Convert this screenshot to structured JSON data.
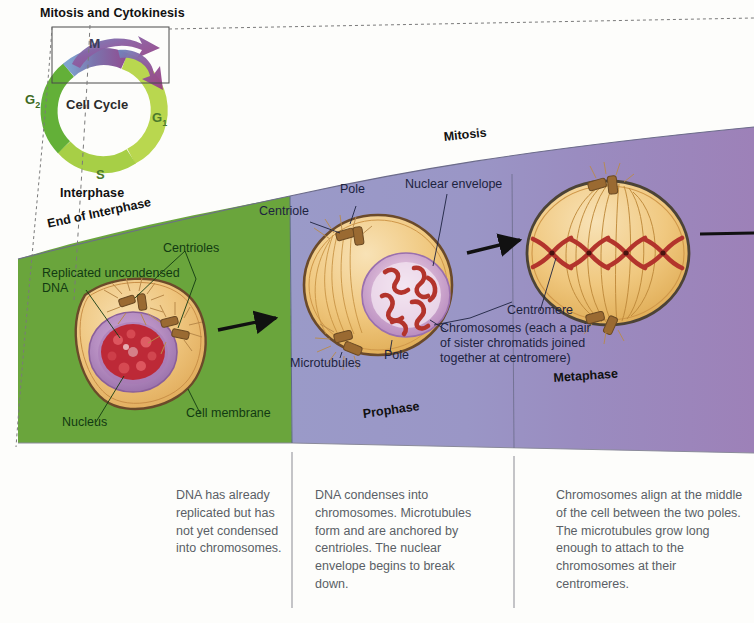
{
  "figure": {
    "cell_cycle": {
      "box_label": "Mitosis and Cytokinesis",
      "center_label": "Cell Cycle",
      "interphase_label": "Interphase",
      "segments": [
        {
          "name": "G1",
          "label": "G",
          "subscript": "1",
          "color": "#b5d44e"
        },
        {
          "name": "S",
          "label": "S",
          "subscript": "",
          "color": "#a6cf4a"
        },
        {
          "name": "G2",
          "label": "G",
          "subscript": "2",
          "color": "#67b23b"
        },
        {
          "name": "M",
          "label": "M",
          "subscript": "",
          "color": "#8d7fb8"
        }
      ]
    },
    "band_label_mitosis": "Mitosis",
    "band_label_end_interphase": "End of Interphase",
    "stages": [
      {
        "id": "interphase",
        "phase_label": "End of Interphase",
        "band_color": "#6aa53c",
        "caption": "DNA has already replicated but has not yet condensed into chromosomes.",
        "callouts": [
          "Replicated uncondensed DNA",
          "Centrioles",
          "Nucleus",
          "Cell membrane"
        ]
      },
      {
        "id": "prophase",
        "phase_label": "Prophase",
        "band_color": "#9a9ac8",
        "caption": "DNA condenses into chromosomes. Microtubules form and are anchored by centrioles. The nuclear envelope begins to break down.",
        "callouts": [
          "Pole",
          "Centriole",
          "Nuclear envelope",
          "Microtubules",
          "Pole"
        ]
      },
      {
        "id": "metaphase",
        "phase_label": "Metaphase",
        "band_color": "#9b81b8",
        "caption": "Chromosomes align at the middle of the cell between the two poles. The microtubules grow long enough to attach to the chromosomes at their centromeres.",
        "callouts": [
          "Centromere",
          "Chromosomes (each a pair of sister chromatids joined together at centromere)"
        ]
      }
    ],
    "callout_text": {
      "replicated_dna_l1": "Replicated uncondensed",
      "replicated_dna_l2": "DNA",
      "centrioles": "Centrioles",
      "nucleus": "Nucleus",
      "cell_membrane": "Cell membrane",
      "pole_top": "Pole",
      "pole_bottom": "Pole",
      "centriole": "Centriole",
      "nuclear_envelope": "Nuclear envelope",
      "microtubules": "Microtubules",
      "centromere": "Centromere",
      "chromosomes_l1": "Chromosomes (each a pair",
      "chromosomes_l2": "of sister chromatids joined",
      "chromosomes_l3": "together at centromere)"
    },
    "colors": {
      "green_band": "#6aa53c",
      "blue_band": "#9a9ac8",
      "purple_band": "#9b81b8",
      "cytoplasm": "#edbf72",
      "cytoplasm_light": "#f3d49a",
      "membrane": "#6b4a2a",
      "nucleus_fill": "#b48ec0",
      "nucleus_inner": "#f0e3ef",
      "chromatin_red": "#c4242c",
      "chromosome_red": "#b3342c",
      "centriole": "#9a6a32"
    }
  }
}
